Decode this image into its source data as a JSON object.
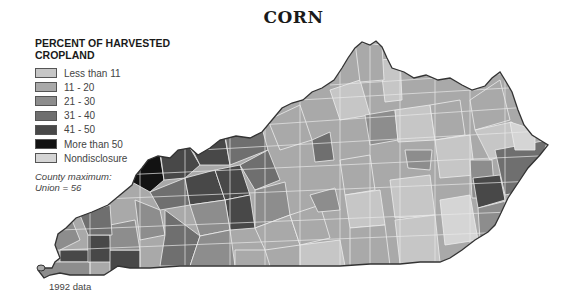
{
  "title": "CORN",
  "legend": {
    "title_line1": "PERCENT OF HARVESTED",
    "title_line2": "CROPLAND",
    "items": [
      {
        "label": "Less than 11",
        "color": "#c6c6c6"
      },
      {
        "label": "11 - 20",
        "color": "#a9a9a9"
      },
      {
        "label": "21 - 30",
        "color": "#8d8d8d"
      },
      {
        "label": "31 - 40",
        "color": "#6f6f6f"
      },
      {
        "label": "41 - 50",
        "color": "#484848"
      },
      {
        "label": "More than 50",
        "color": "#121212"
      },
      {
        "label": "Nondisclosure",
        "color": "#d5d5d5"
      }
    ],
    "note_line1": "County maximum:",
    "note_line2": "Union = 56"
  },
  "footer": "1992 data",
  "map": {
    "region": "Kentucky",
    "unit": "county",
    "outline_color": "#333333",
    "border_color": "#eeeeee"
  }
}
